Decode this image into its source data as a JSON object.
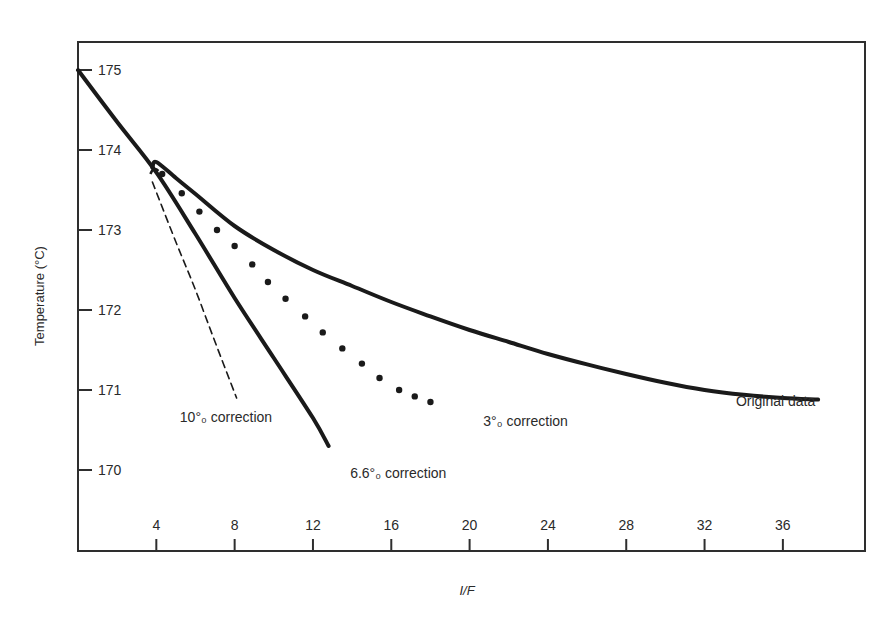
{
  "chart_data": {
    "type": "line",
    "title": "",
    "xlabel": "I/F",
    "ylabel": "Temperature (°C)",
    "xlim": [
      0,
      40
    ],
    "ylim": [
      169.0,
      175.35
    ],
    "grid": false,
    "legend": "none (direct curve annotations)",
    "x_ticks": [
      4,
      8,
      12,
      16,
      20,
      24,
      28,
      32,
      36
    ],
    "y_ticks": [
      170,
      171,
      172,
      173,
      174,
      175
    ],
    "series": [
      {
        "name": "Original data",
        "style": "solid-thick",
        "label": "Original data",
        "label_pos": [
          33.6,
          170.8
        ],
        "x": [
          3.8,
          4.0,
          5,
          6,
          8,
          10,
          12,
          14,
          16,
          18,
          20,
          22,
          24,
          26,
          28,
          30,
          32,
          34,
          36,
          37.8
        ],
        "y": [
          173.78,
          173.85,
          173.65,
          173.45,
          173.05,
          172.75,
          172.5,
          172.3,
          172.1,
          171.92,
          171.75,
          171.6,
          171.45,
          171.32,
          171.2,
          171.09,
          171.0,
          170.94,
          170.9,
          170.88
        ]
      },
      {
        "name": "3% correction",
        "style": "dotted",
        "label": "3°₀ correction",
        "label_pos": [
          20.7,
          170.55
        ],
        "x": [
          4.3,
          5.3,
          6.2,
          7.1,
          8.0,
          8.9,
          9.7,
          10.6,
          11.6,
          12.5,
          13.5,
          14.5,
          15.4,
          16.4,
          17.2,
          18.0
        ],
        "y": [
          173.7,
          173.46,
          173.23,
          173.0,
          172.8,
          172.57,
          172.35,
          172.14,
          171.92,
          171.72,
          171.52,
          171.33,
          171.15,
          171.0,
          170.92,
          170.85
        ]
      },
      {
        "name": "6.6% correction",
        "style": "solid-thick",
        "label": "6.6°₀ correction",
        "label_pos": [
          13.9,
          169.9
        ],
        "x": [
          0,
          2,
          4,
          6,
          8,
          10,
          12,
          12.8
        ],
        "y": [
          175.0,
          174.35,
          173.72,
          172.95,
          172.15,
          171.4,
          170.65,
          170.3
        ]
      },
      {
        "name": "10% correction",
        "style": "dashed",
        "label": "10°₀ correction",
        "label_pos": [
          5.2,
          170.6
        ],
        "x": [
          3.8,
          5,
          6,
          7,
          8.1
        ],
        "y": [
          173.6,
          172.85,
          172.25,
          171.6,
          170.9
        ]
      }
    ],
    "annotations": [
      "10°₀ correction",
      "6.6°₀ correction",
      "3°₀ correction",
      "Original data"
    ]
  },
  "labels": {
    "xlabel": "I/F",
    "ylabel": "Temperature (°C)",
    "original": "Original data",
    "c3": "3°₀ correction",
    "c66": "6.6°₀ correction",
    "c10": "10°₀ correction"
  },
  "colors": {
    "ink": "#1a1a1a",
    "frame": "#2e2e2e",
    "background": "#ffffff"
  }
}
